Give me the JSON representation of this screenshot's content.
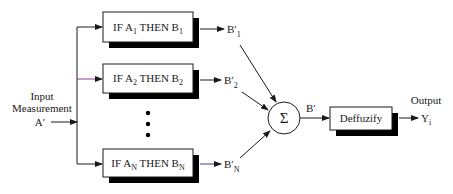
{
  "diagram": {
    "type": "fuzzy-inference-system",
    "input": {
      "line1": "Input",
      "line2": "Measurement",
      "symbol": "A′"
    },
    "rules": [
      {
        "pre": "IF A",
        "pre_sub": "1",
        "mid": " THEN B",
        "post_sub": "1",
        "out": "B′",
        "out_sub": "1"
      },
      {
        "pre": "IF A",
        "pre_sub": "2",
        "mid": " THEN B",
        "post_sub": "2",
        "out": "B′",
        "out_sub": "2"
      },
      {
        "pre": "IF A",
        "pre_sub": "N",
        "mid": " THEN B",
        "post_sub": "N",
        "out": "B′",
        "out_sub": "N"
      }
    ],
    "ellipsis": "⋮",
    "aggregator": {
      "symbol": "Σ",
      "output": "B′"
    },
    "defuzzifier": {
      "label": "Deffuzify"
    },
    "output": {
      "label": "Output",
      "symbol": "Y",
      "symbol_sub": "i"
    },
    "colors": {
      "line": "#1a1a1a",
      "shadow": "#000000",
      "box_fill": "#ffffff",
      "accent_line": "#8a3a9a",
      "accent_line_n": "#3a3aa0"
    }
  }
}
